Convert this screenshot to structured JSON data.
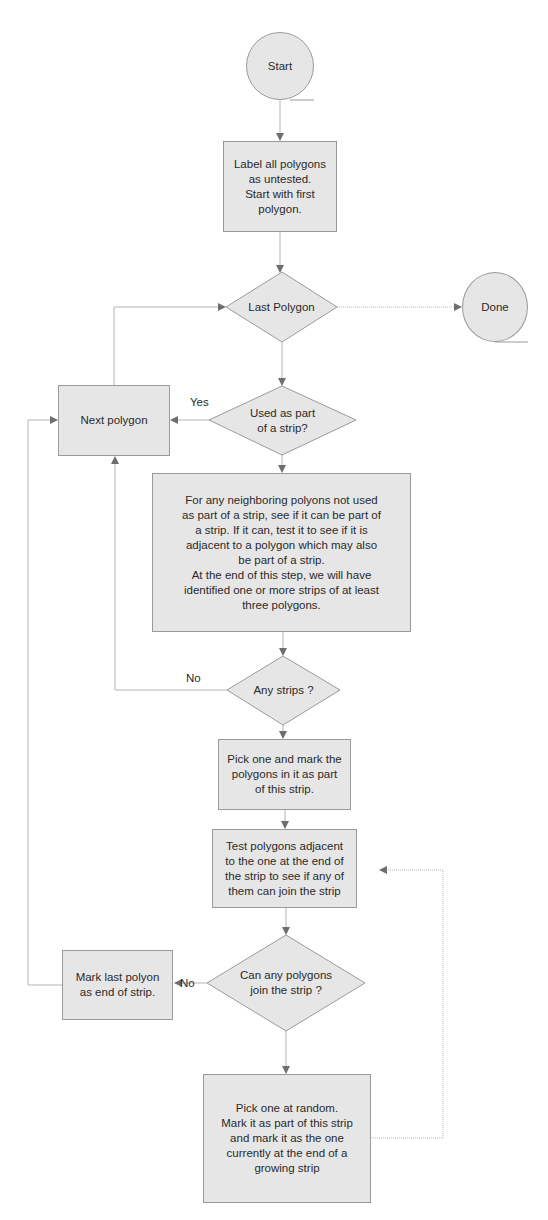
{
  "nodes": {
    "start": "Start",
    "label_all": "Label all polygons\nas untested.\nStart with first\npolygon.",
    "last_polygon": "Last Polygon",
    "done": "Done",
    "next_polygon": "Next polygon",
    "used_as_part": "Used as part\nof a strip?",
    "for_any_neighboring": "For any neighboring polyons not used\nas part of a strip, see  if it can be part of\na strip. If it can, test it to see if it is\nadjacent to a polygon which may also\nbe part of a strip.\nAt the end of this step, we will have\nidentified one or more strips of at least\nthree polygons.",
    "any_strips": "Any strips ?",
    "pick_one_mark": "Pick one and mark the\npolygons in it as part\nof this strip.",
    "test_adjacent": "Test polygons adjacent\nto the one at the end of\nthe strip to see if any of\nthem can join the strip",
    "can_any_join": "Can any polygons\njoin the strip ?",
    "mark_last": "Mark last polyon\nas end of strip.",
    "pick_random": "Pick one at random.\nMark it as part of this strip\nand mark it as the one\ncurrently at the end of a\ngrowing strip"
  },
  "edge_labels": {
    "yes": "Yes",
    "no_any_strips": "No",
    "no_can_join": "No"
  },
  "colors": {
    "fill": "#e6e6e6",
    "stroke": "#9a9a9a",
    "line": "#b5b5b5",
    "arrow": "#6e6e6e"
  }
}
